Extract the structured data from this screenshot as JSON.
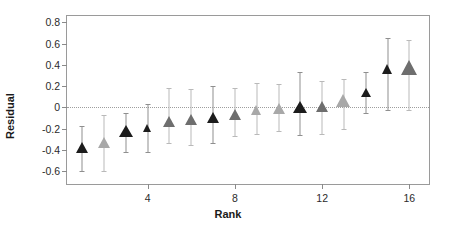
{
  "chart_data": {
    "type": "scatter",
    "title": "",
    "xlabel": "Rank",
    "ylabel": "Residual",
    "xlim": [
      0.3,
      16.9
    ],
    "ylim": [
      -0.72,
      0.86
    ],
    "grid": false,
    "legend": null,
    "reference_line": {
      "y": 0,
      "style": "dotted"
    },
    "xticks": [
      4,
      8,
      12,
      16
    ],
    "xtick_labels": [
      "4",
      "8",
      "12",
      "16"
    ],
    "yticks": [
      0.8,
      0.6,
      0.4,
      0.2,
      0,
      -0.2,
      -0.4,
      -0.6
    ],
    "ytick_labels": [
      "0.8",
      "0.6",
      "0.4",
      "0.2",
      "0",
      "-0.2",
      "-0.4",
      "-0.6"
    ],
    "marker": "triangle-up",
    "colors": {
      "dark": "#1c1c1c",
      "mid": "#6e6e6e",
      "light": "#a8a8a8",
      "errorbar": "#b9b9b9",
      "errorbar_dark": "#8f8f8f",
      "axis": "#9a9a9a",
      "text": "#1a1a1a",
      "zero_line": "#9e9e9e"
    },
    "points": [
      {
        "rank": 1,
        "residual": -0.38,
        "lower": -0.6,
        "upper": -0.17,
        "color": "#1c1c1c",
        "size": 13
      },
      {
        "rank": 2,
        "residual": -0.33,
        "lower": -0.6,
        "upper": -0.07,
        "color": "#a8a8a8",
        "size": 12
      },
      {
        "rank": 3,
        "residual": -0.23,
        "lower": -0.42,
        "upper": -0.05,
        "color": "#1c1c1c",
        "size": 14
      },
      {
        "rank": 4,
        "residual": -0.19,
        "lower": -0.42,
        "upper": 0.03,
        "color": "#1c1c1c",
        "size": 9
      },
      {
        "rank": 5,
        "residual": -0.14,
        "lower": -0.33,
        "upper": 0.18,
        "color": "#6e6e6e",
        "size": 13
      },
      {
        "rank": 6,
        "residual": -0.12,
        "lower": -0.35,
        "upper": 0.17,
        "color": "#6e6e6e",
        "size": 13
      },
      {
        "rank": 7,
        "residual": -0.1,
        "lower": -0.33,
        "upper": 0.2,
        "color": "#1c1c1c",
        "size": 13
      },
      {
        "rank": 8,
        "residual": -0.07,
        "lower": -0.27,
        "upper": 0.18,
        "color": "#6e6e6e",
        "size": 12
      },
      {
        "rank": 9,
        "residual": -0.02,
        "lower": -0.25,
        "upper": 0.23,
        "color": "#a8a8a8",
        "size": 11
      },
      {
        "rank": 10,
        "residual": -0.01,
        "lower": -0.22,
        "upper": 0.22,
        "color": "#a8a8a8",
        "size": 12
      },
      {
        "rank": 11,
        "residual": 0.0,
        "lower": -0.26,
        "upper": 0.33,
        "color": "#1c1c1c",
        "size": 14
      },
      {
        "rank": 12,
        "residual": 0.01,
        "lower": -0.25,
        "upper": 0.25,
        "color": "#6e6e6e",
        "size": 12
      },
      {
        "rank": 13,
        "residual": 0.06,
        "lower": -0.2,
        "upper": 0.27,
        "color": "#a8a8a8",
        "size": 15
      },
      {
        "rank": 14,
        "residual": 0.14,
        "lower": -0.05,
        "upper": 0.33,
        "color": "#1c1c1c",
        "size": 10
      },
      {
        "rank": 15,
        "residual": 0.36,
        "lower": -0.02,
        "upper": 0.65,
        "color": "#1c1c1c",
        "size": 11
      },
      {
        "rank": 16,
        "residual": 0.37,
        "lower": -0.02,
        "upper": 0.63,
        "color": "#6e6e6e",
        "size": 17
      }
    ]
  }
}
